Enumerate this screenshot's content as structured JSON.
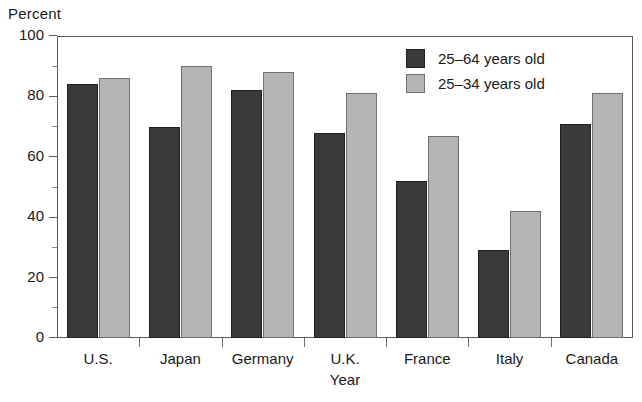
{
  "chart_data": {
    "type": "bar",
    "title": "",
    "xlabel": "Year",
    "ylabel": "Percent",
    "categories": [
      "U.S.",
      "Japan",
      "Germany",
      "U.K.",
      "France",
      "Italy",
      "Canada"
    ],
    "series": [
      {
        "name": "25–64 years old",
        "color": "#3a3a3a",
        "values": [
          84,
          70,
          82,
          68,
          52,
          29,
          71
        ]
      },
      {
        "name": "25–34 years old",
        "color": "#b5b5b5",
        "values": [
          86,
          90,
          88,
          81,
          67,
          42,
          81
        ]
      }
    ],
    "ylim": [
      0,
      100
    ],
    "yticks": [
      0,
      20,
      40,
      60,
      80,
      100
    ],
    "ytick_labels": [
      "0",
      "20",
      "40",
      "60",
      "80",
      "100"
    ],
    "yminor_ticks": [
      10,
      30,
      50,
      70,
      90
    ],
    "grid": false,
    "legend_position": "top-right"
  }
}
